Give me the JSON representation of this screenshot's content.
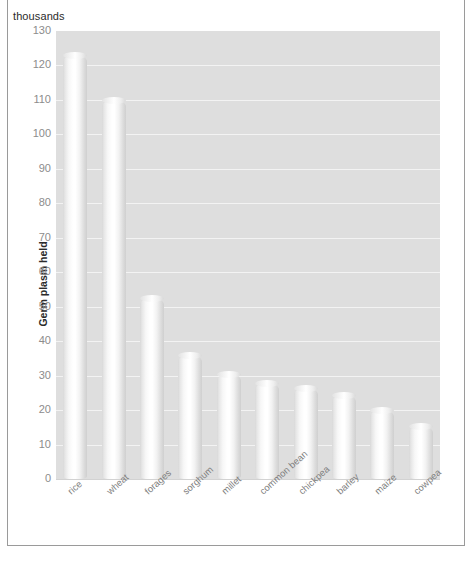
{
  "chart_data": {
    "type": "bar",
    "title": "",
    "subtitle": "",
    "unit_label": "thousands",
    "xlabel": "",
    "ylabel": "Germ plasm held",
    "ylim": [
      0,
      130
    ],
    "ytick_step": 10,
    "grid": true,
    "legend": false,
    "categories": [
      "rice",
      "wheat",
      "forages",
      "sorghum",
      "millet",
      "common bean",
      "chickpea",
      "barley",
      "maize",
      "cowpea"
    ],
    "values": [
      123,
      110,
      52.5,
      36,
      30.5,
      28,
      26.5,
      24.5,
      20,
      15.5
    ],
    "ytick_labels": [
      "130",
      "120",
      "110",
      "100",
      "90",
      "80",
      "70",
      "60",
      "50",
      "40",
      "30",
      "20",
      "10",
      "0"
    ],
    "ytick_values": [
      130,
      120,
      110,
      100,
      90,
      80,
      70,
      60,
      50,
      40,
      30,
      20,
      10,
      0
    ]
  },
  "colors": {
    "plot_background": "#dedede",
    "gridline": "#f3f3f3",
    "bar_light": "#ffffff",
    "bar_shadow": "#cfcfcf",
    "tick_text": "#8c8c8c",
    "axis_title_text": "#2b2b2b",
    "frame": "#9a9a9a",
    "page_background": "#ffffff"
  }
}
